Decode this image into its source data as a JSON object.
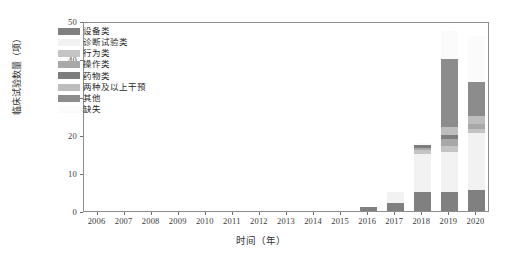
{
  "chart_data": {
    "type": "bar",
    "stacked": true,
    "title": "",
    "xlabel": "时间（年）",
    "ylabel": "临床试验数量（项）",
    "categories": [
      "2006",
      "2007",
      "2008",
      "2009",
      "2010",
      "2011",
      "2012",
      "2013",
      "2014",
      "2015",
      "2016",
      "2017",
      "2018",
      "2019",
      "2020"
    ],
    "ylim": [
      0,
      50
    ],
    "yticks": [
      0,
      10,
      20,
      30,
      40,
      50
    ],
    "grid": false,
    "legend_position": "upper-left-inside",
    "series": [
      {
        "name": "设备类",
        "color": "#808080",
        "values": [
          0,
          0,
          0,
          0,
          0,
          0,
          0,
          0,
          0,
          0,
          1,
          2,
          5,
          5,
          5.5
        ]
      },
      {
        "name": "诊断试验类",
        "color": "#f2f2f2",
        "values": [
          0,
          0,
          0,
          0,
          0,
          0,
          0,
          0,
          0,
          0,
          0,
          3,
          10,
          10.5,
          15
        ]
      },
      {
        "name": "行为类",
        "color": "#c4c4c4",
        "values": [
          0,
          0,
          0,
          0,
          0,
          0,
          0,
          0,
          0,
          0,
          0,
          0,
          1,
          1.5,
          1
        ]
      },
      {
        "name": "操作类",
        "color": "#a8a8a8",
        "values": [
          0,
          0,
          0,
          0,
          0,
          0,
          0,
          0,
          0,
          0,
          0,
          0,
          0.5,
          2,
          1.5
        ]
      },
      {
        "name": "药物类",
        "color": "#7d7d7d",
        "values": [
          0,
          0,
          0,
          0,
          0,
          0,
          0,
          0,
          0,
          0,
          0,
          0,
          1,
          1,
          0
        ]
      },
      {
        "name": "两种及以上干预",
        "color": "#bdbdbd",
        "values": [
          0,
          0,
          0,
          0,
          0,
          0,
          0,
          0,
          0,
          0,
          0,
          0,
          0,
          2,
          2
        ]
      },
      {
        "name": "其他",
        "color": "#8c8c8c",
        "values": [
          0,
          0,
          0,
          0,
          0,
          0,
          0,
          0,
          0,
          0,
          0,
          0,
          0,
          18,
          9
        ]
      },
      {
        "name": "缺失",
        "color": "#fbfbfb",
        "values": [
          0,
          0,
          0,
          0,
          0,
          0,
          0,
          0,
          0,
          0,
          0,
          0,
          0.5,
          7.5,
          12
        ]
      }
    ],
    "totals": [
      0,
      0,
      0,
      0,
      0,
      0,
      0,
      0,
      0,
      0,
      1,
      5,
      18,
      47.5,
      46
    ]
  },
  "legend": {
    "items": [
      {
        "label": "设备类",
        "color": "#808080"
      },
      {
        "label": "诊断试验类",
        "color": "#f2f2f2"
      },
      {
        "label": "行为类",
        "color": "#c4c4c4"
      },
      {
        "label": "操作类",
        "color": "#a8a8a8"
      },
      {
        "label": "药物类",
        "color": "#7d7d7d"
      },
      {
        "label": "两种及以上干预",
        "color": "#bdbdbd"
      },
      {
        "label": "其他",
        "color": "#8c8c8c"
      },
      {
        "label": "缺失",
        "color": "#fbfbfb"
      }
    ]
  },
  "axes": {
    "y_title": "临床试验数量（项）",
    "x_title": "时间（年）",
    "y_tick_labels": [
      "0",
      "10",
      "20",
      "30",
      "40",
      "50"
    ],
    "x_tick_labels": [
      "2006",
      "2007",
      "2008",
      "2009",
      "2010",
      "2011",
      "2012",
      "2013",
      "2014",
      "2015",
      "2016",
      "2017",
      "2018",
      "2019",
      "2020"
    ]
  }
}
